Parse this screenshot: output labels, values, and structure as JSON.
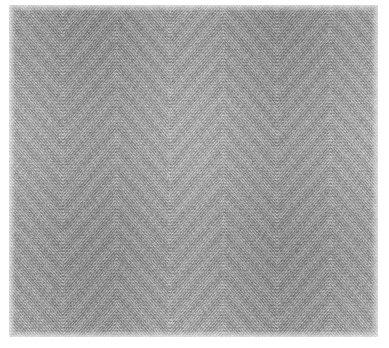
{
  "page": {
    "background_color": "#ffffff",
    "width": 389,
    "height": 348
  },
  "swatch": {
    "name": "herringbone-twill-weave",
    "description": "Grayscale close-up photograph of a herringbone (chevron) twill woven textile",
    "left": 9,
    "top": 5,
    "width": 369,
    "height": 332,
    "base_color": "#9c9c9c",
    "highlight_color": "#e4e4e4",
    "shadow_color": "#555555",
    "mid_color": "#a8a8a8"
  },
  "pattern": {
    "type": "herringbone-chevron",
    "apex_direction": "down",
    "horizontal_period_px": 107,
    "vertical_period_px": 62,
    "twill_line_spacing_px": 3.5,
    "twill_angle_deg": 52,
    "weft_row_spacing_px": 3.2,
    "apex_x_positions": [
      0,
      105,
      215,
      320
    ],
    "seam_x_positions": [
      52,
      160,
      267,
      372
    ],
    "noise_amount": 0.22,
    "contrast": 0.55
  },
  "chart_data": {
    "type": "heatmap",
    "xlabel": "",
    "ylabel": "",
    "grid": false,
    "legend": "none",
    "value_range": [
      55,
      228
    ],
    "units": "gray level (0-255)"
  }
}
